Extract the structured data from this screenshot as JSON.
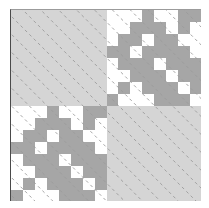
{
  "figure": {
    "title": "",
    "width": 209,
    "height": 208,
    "background": "#ffffff",
    "plot_left": 10,
    "plot_top": 9,
    "plot_width": 191,
    "plot_height": 192,
    "axis_left_color": "#4a4a4a",
    "axis_top_color": "#9b9b9b"
  },
  "palette": {
    "white": "#ffffff",
    "light_gray": "#d5d5d5",
    "medium_gray": "#a6a6a6",
    "dash_line": "#9a9a9a",
    "axis": "#4a4a4a"
  },
  "chart_data": {
    "type": "heatmap",
    "title": "",
    "xlabel": "",
    "ylabel": "",
    "grid": false,
    "legend": "none",
    "rows": 16,
    "cols": 16,
    "value_colors": {
      "0": "#ffffff",
      "1": "#d5d5d5",
      "2": "#a6a6a6"
    },
    "xlim": [
      0,
      16
    ],
    "ylim": [
      0,
      16
    ],
    "xticklabels": [],
    "yticklabels": [],
    "block_structure": {
      "blocks": [
        {
          "name": "top-left",
          "row_range": [
            0,
            8
          ],
          "col_range": [
            0,
            8
          ],
          "fill": "uniform-light-gray"
        },
        {
          "name": "top-right",
          "row_range": [
            0,
            8
          ],
          "col_range": [
            8,
            16
          ],
          "fill": "antidiagonal-band-checker"
        },
        {
          "name": "bottom-left",
          "row_range": [
            8,
            16
          ],
          "col_range": [
            0,
            8
          ],
          "fill": "antidiagonal-band-checker"
        },
        {
          "name": "bottom-right",
          "row_range": [
            8,
            16
          ],
          "col_range": [
            8,
            16
          ],
          "fill": "uniform-light-gray"
        }
      ]
    },
    "matrix": [
      [
        1,
        1,
        1,
        1,
        1,
        1,
        1,
        1,
        0,
        0,
        0,
        2,
        0,
        0,
        2,
        2
      ],
      [
        1,
        1,
        1,
        1,
        1,
        1,
        1,
        1,
        0,
        0,
        2,
        2,
        2,
        0,
        2,
        0
      ],
      [
        1,
        1,
        1,
        1,
        1,
        1,
        1,
        1,
        0,
        2,
        2,
        0,
        2,
        2,
        0,
        0
      ],
      [
        1,
        1,
        1,
        1,
        1,
        1,
        1,
        1,
        2,
        2,
        0,
        2,
        2,
        2,
        2,
        0
      ],
      [
        1,
        1,
        1,
        1,
        1,
        1,
        1,
        1,
        0,
        2,
        2,
        2,
        0,
        2,
        2,
        2
      ],
      [
        1,
        1,
        1,
        1,
        1,
        1,
        1,
        1,
        0,
        0,
        2,
        2,
        2,
        0,
        2,
        2
      ],
      [
        1,
        1,
        1,
        1,
        1,
        1,
        1,
        1,
        0,
        2,
        0,
        2,
        2,
        2,
        0,
        2
      ],
      [
        1,
        1,
        1,
        1,
        1,
        1,
        1,
        1,
        2,
        0,
        0,
        0,
        2,
        2,
        2,
        0
      ],
      [
        0,
        0,
        0,
        2,
        0,
        0,
        2,
        2,
        1,
        1,
        1,
        1,
        1,
        1,
        1,
        1
      ],
      [
        0,
        0,
        2,
        2,
        2,
        0,
        2,
        0,
        1,
        1,
        1,
        1,
        1,
        1,
        1,
        1
      ],
      [
        0,
        2,
        2,
        0,
        2,
        2,
        0,
        0,
        1,
        1,
        1,
        1,
        1,
        1,
        1,
        1
      ],
      [
        2,
        2,
        0,
        2,
        2,
        2,
        2,
        0,
        1,
        1,
        1,
        1,
        1,
        1,
        1,
        1
      ],
      [
        0,
        2,
        2,
        2,
        0,
        2,
        2,
        2,
        1,
        1,
        1,
        1,
        1,
        1,
        1,
        1
      ],
      [
        0,
        0,
        2,
        2,
        2,
        0,
        2,
        2,
        1,
        1,
        1,
        1,
        1,
        1,
        1,
        1
      ],
      [
        0,
        2,
        0,
        2,
        2,
        2,
        0,
        2,
        1,
        1,
        1,
        1,
        1,
        1,
        1,
        1
      ],
      [
        2,
        0,
        0,
        0,
        2,
        2,
        2,
        0,
        1,
        1,
        1,
        1,
        1,
        1,
        1,
        1
      ]
    ],
    "annotations": {
      "diagonal_dash_lines": {
        "orientation": "top-left-to-bottom-right",
        "style": "dashed",
        "color": "#9a9a9a",
        "spacing_px": 18,
        "count": 21
      }
    }
  }
}
